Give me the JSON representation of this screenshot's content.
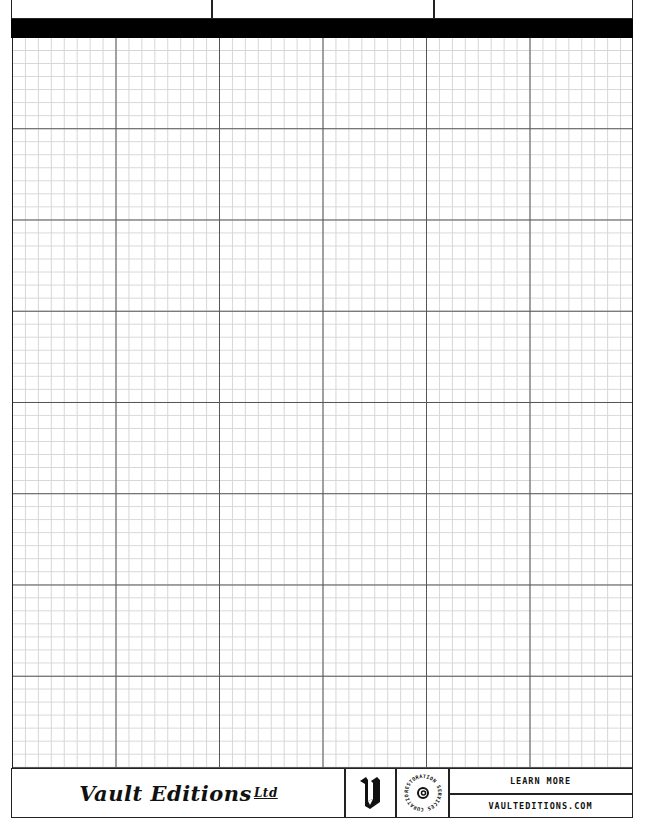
{
  "header": {
    "title_partial": "· · · · · ·",
    "divider_positions": [
      210,
      432
    ]
  },
  "grid": {
    "major_columns": 6,
    "major_rows": 8,
    "minor_per_major_col": 8,
    "minor_per_major_row": 7,
    "major_line_color": "#555555",
    "minor_line_color": "#d6d6d6"
  },
  "footer": {
    "brand_name": "Vault Editions",
    "brand_suffix": "Ltd",
    "logo_letter": "V",
    "badge_text": "RESTORATION SERVICES CURATION AND",
    "learn_more": "LEARN MORE",
    "website": "VAULTEDITIONS.COM"
  }
}
